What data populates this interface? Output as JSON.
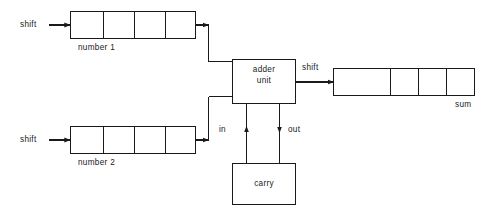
{
  "diagram": {
    "type": "block-diagram",
    "canvas": {
      "width": 495,
      "height": 217
    },
    "stroke_color": "#1a1a1a",
    "background_color": "#ffffff"
  },
  "registers": {
    "number1": {
      "label": "number 1",
      "cells": 4,
      "input_label": "shift"
    },
    "number2": {
      "label": "number 2",
      "cells": 4,
      "input_label": "shift"
    },
    "sum": {
      "label": "sum",
      "cells": 4,
      "input_label": "shift"
    }
  },
  "blocks": {
    "adder": {
      "line1": "adder",
      "line2": "unit"
    },
    "carry": {
      "line1": "carry"
    }
  },
  "signals": {
    "carry_in": "in",
    "carry_out": "out",
    "shift_number1": "shift",
    "shift_number2": "shift",
    "shift_sum": "shift"
  }
}
